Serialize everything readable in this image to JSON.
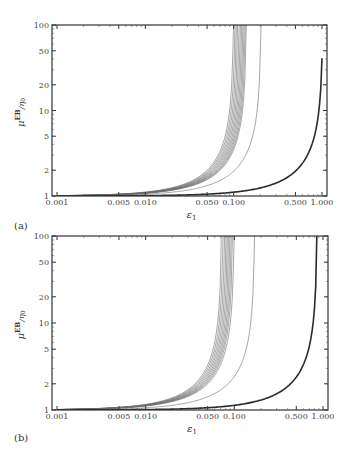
{
  "figure": {
    "panels": [
      {
        "id": "a",
        "label": "(a)"
      },
      {
        "id": "b",
        "label": "(b)"
      }
    ]
  },
  "axes": {
    "xlabel": "ε",
    "xlabel_sub": "1",
    "ylabel_main": "μ",
    "ylabel_sup": "EB",
    "ylabel_tail": "/η",
    "ylabel_sub": "0",
    "xticks": [
      "0.001",
      "0.005",
      "0.010",
      "0.050",
      "0.100",
      "0.500",
      "1.000"
    ],
    "yticks": [
      "1",
      "2",
      "5",
      "10",
      "20",
      "50",
      "100"
    ]
  },
  "chart_data": [
    {
      "type": "line",
      "panel": "(a)",
      "title": "",
      "xlabel": "ε1",
      "ylabel": "μ^EB/η0",
      "xscale": "log",
      "yscale": "log",
      "xlim": [
        0.001,
        1.0
      ],
      "ylim": [
        1,
        100
      ],
      "grid": false,
      "legend": "none",
      "xticks": [
        0.001,
        0.005,
        0.01,
        0.05,
        0.1,
        0.5,
        1.0
      ],
      "yticks": [
        1,
        2,
        5,
        10,
        20,
        50,
        100
      ],
      "series": [
        {
          "name": "thin-1",
          "asymptote_eps": 0.1,
          "style": "thin"
        },
        {
          "name": "thin-2",
          "asymptote_eps": 0.104,
          "style": "thin"
        },
        {
          "name": "thin-3",
          "asymptote_eps": 0.108,
          "style": "thin"
        },
        {
          "name": "thin-4",
          "asymptote_eps": 0.112,
          "style": "thin"
        },
        {
          "name": "thin-5",
          "asymptote_eps": 0.116,
          "style": "thin"
        },
        {
          "name": "thin-6",
          "asymptote_eps": 0.12,
          "style": "thin"
        },
        {
          "name": "thin-7",
          "asymptote_eps": 0.124,
          "style": "thin"
        },
        {
          "name": "thin-8",
          "asymptote_eps": 0.128,
          "style": "thin"
        },
        {
          "name": "thin-9",
          "asymptote_eps": 0.132,
          "style": "thin"
        },
        {
          "name": "thin-10",
          "asymptote_eps": 0.136,
          "style": "thin"
        },
        {
          "name": "thin-11",
          "asymptote_eps": 0.14,
          "style": "thin"
        },
        {
          "name": "thin-12",
          "asymptote_eps": 0.205,
          "style": "thin"
        },
        {
          "name": "thick",
          "asymptote_eps": 1.025,
          "style": "thick",
          "value_at_1": 40
        }
      ]
    },
    {
      "type": "line",
      "panel": "(b)",
      "title": "",
      "xlabel": "ε1",
      "ylabel": "μ^EB/η0",
      "xscale": "log",
      "yscale": "log",
      "xlim": [
        0.001,
        1.0
      ],
      "ylim": [
        1,
        100
      ],
      "grid": false,
      "legend": "none",
      "xticks": [
        0.001,
        0.005,
        0.01,
        0.05,
        0.1,
        0.5,
        1.0
      ],
      "yticks": [
        1,
        2,
        5,
        10,
        20,
        50,
        100
      ],
      "series": [
        {
          "name": "thin-1",
          "asymptote_eps": 0.072,
          "style": "thin"
        },
        {
          "name": "thin-2",
          "asymptote_eps": 0.075,
          "style": "thin"
        },
        {
          "name": "thin-3",
          "asymptote_eps": 0.078,
          "style": "thin"
        },
        {
          "name": "thin-4",
          "asymptote_eps": 0.081,
          "style": "thin"
        },
        {
          "name": "thin-5",
          "asymptote_eps": 0.084,
          "style": "thin"
        },
        {
          "name": "thin-6",
          "asymptote_eps": 0.087,
          "style": "thin"
        },
        {
          "name": "thin-7",
          "asymptote_eps": 0.09,
          "style": "thin"
        },
        {
          "name": "thin-8",
          "asymptote_eps": 0.093,
          "style": "thin"
        },
        {
          "name": "thin-9",
          "asymptote_eps": 0.096,
          "style": "thin"
        },
        {
          "name": "thin-10",
          "asymptote_eps": 0.1,
          "style": "thin"
        },
        {
          "name": "thin-11",
          "asymptote_eps": 0.17,
          "style": "thin"
        },
        {
          "name": "thick",
          "asymptote_eps": 0.86,
          "style": "thick"
        }
      ]
    }
  ]
}
